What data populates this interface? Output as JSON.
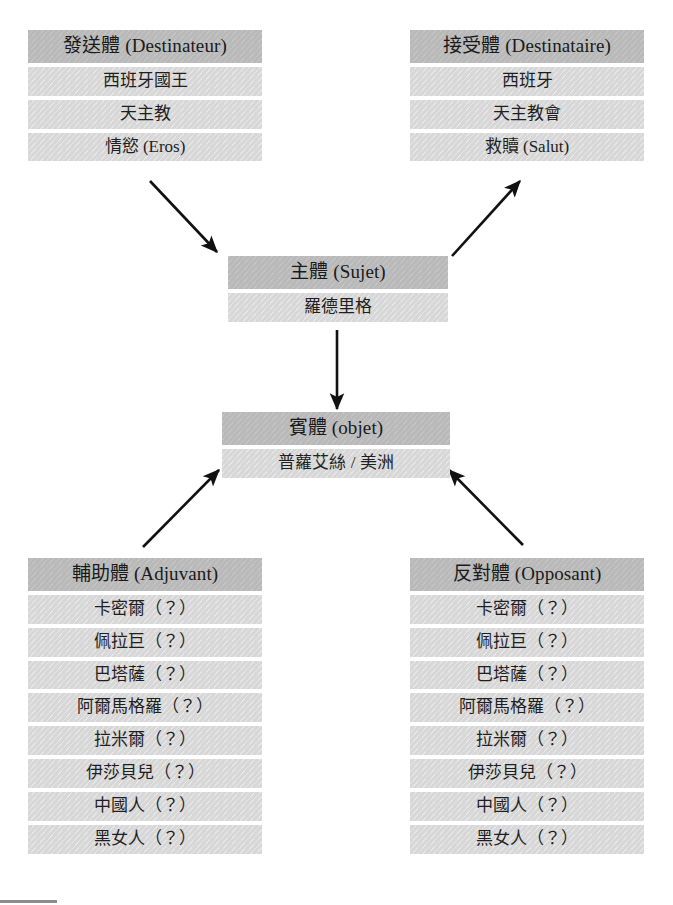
{
  "diagram": {
    "colors": {
      "header_bg": "#b9b9b9",
      "item_bg": "#d7d7d7",
      "text": "#1a1a1a",
      "arrow": "#111111",
      "page_bg": "#ffffff",
      "rule": "#8d8d8d"
    },
    "boxes": [
      {
        "id": "destinateur",
        "header": "發送體 (Destinateur)",
        "items": [
          "西班牙國王",
          "天主教",
          "情慾 (Eros)"
        ]
      },
      {
        "id": "destinataire",
        "header": "接受體 (Destinataire)",
        "items": [
          "西班牙",
          "天主教會",
          "救贖 (Salut)"
        ]
      },
      {
        "id": "sujet",
        "header": "主體 (Sujet)",
        "items": [
          "羅德里格"
        ]
      },
      {
        "id": "objet",
        "header": "賓體 (objet)",
        "items": [
          "普蘿艾絲 / 美洲"
        ]
      },
      {
        "id": "adjuvant",
        "header": "輔助體 (Adjuvant)",
        "items": [
          "卡密爾（？）",
          "佩拉巨（？）",
          "巴塔薩（？）",
          "阿爾馬格羅（？）",
          "拉米爾（？）",
          "伊莎貝兒（？）",
          "中國人（？）",
          "黑女人（？）"
        ]
      },
      {
        "id": "opposant",
        "header": "反對體 (Opposant)",
        "items": [
          "卡密爾（？）",
          "佩拉巨（？）",
          "巴塔薩（？）",
          "阿爾馬格羅（？）",
          "拉米爾（？）",
          "伊莎貝兒（？）",
          "中國人（？）",
          "黑女人（？）"
        ]
      }
    ],
    "arrows": [
      {
        "id": "destinateur-to-sujet",
        "from": "destinateur",
        "to": "sujet",
        "x1": 150,
        "y1": 181,
        "x2": 217,
        "y2": 252
      },
      {
        "id": "sujet-to-destinataire",
        "from": "sujet",
        "to": "destinataire",
        "x1": 452,
        "y1": 256,
        "x2": 520,
        "y2": 181
      },
      {
        "id": "sujet-to-objet",
        "from": "sujet",
        "to": "objet",
        "x1": 337,
        "y1": 330,
        "x2": 337,
        "y2": 409
      },
      {
        "id": "adjuvant-to-objet",
        "from": "adjuvant",
        "to": "objet",
        "x1": 143,
        "y1": 547,
        "x2": 219,
        "y2": 470
      },
      {
        "id": "opposant-to-objet",
        "from": "opposant",
        "to": "objet",
        "x1": 523,
        "y1": 545,
        "x2": 449,
        "y2": 470
      }
    ]
  }
}
